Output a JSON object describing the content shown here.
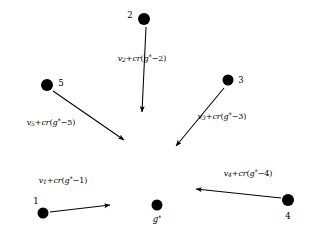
{
  "diagram": {
    "background_color": "#ffffff",
    "stroke_color": "#000000",
    "center": {
      "id": "g-star",
      "label_var": "g",
      "label_sup": "*",
      "x": 157,
      "y": 205,
      "radius": 5.5,
      "label_x": 157,
      "label_y": 219
    },
    "nodes": [
      {
        "id": "node-1",
        "label": "1",
        "x": 43,
        "y": 213,
        "radius": 5.5,
        "label_x": 36,
        "label_y": 201
      },
      {
        "id": "node-2",
        "label": "2",
        "x": 144,
        "y": 19,
        "radius": 6.0,
        "label_x": 130,
        "label_y": 15
      },
      {
        "id": "node-3",
        "label": "3",
        "x": 228,
        "y": 80,
        "radius": 5.5,
        "label_x": 241,
        "label_y": 80
      },
      {
        "id": "node-4",
        "label": "4",
        "x": 288,
        "y": 200,
        "radius": 6.0,
        "label_x": 288,
        "label_y": 216
      },
      {
        "id": "node-5",
        "label": "5",
        "x": 47,
        "y": 85,
        "radius": 6.0,
        "label_x": 61,
        "label_y": 83
      }
    ],
    "edges": [
      {
        "id": "edge-1",
        "from": "node-1",
        "to": "g-star",
        "x1": 50,
        "y1": 212,
        "x2": 110,
        "y2": 205,
        "label_var": "v",
        "label_sub": "1",
        "label_fn": "cr",
        "label_sup": "*",
        "label_num": "1",
        "label_text": "v1+cr(g*-1)",
        "label_x": 63,
        "label_y": 180
      },
      {
        "id": "edge-2",
        "from": "node-2",
        "to": "g-star",
        "x1": 146,
        "y1": 27,
        "x2": 142,
        "y2": 112,
        "label_var": "v",
        "label_sub": "2",
        "label_fn": "cr",
        "label_sup": "*",
        "label_num": "2",
        "label_text": "v2+cr(g*-2)",
        "label_x": 142,
        "label_y": 58
      },
      {
        "id": "edge-3",
        "from": "node-3",
        "to": "g-star",
        "x1": 224,
        "y1": 88,
        "x2": 176,
        "y2": 146,
        "label_var": "v",
        "label_sub": "3",
        "label_fn": "cr",
        "label_sup": "*",
        "label_num": "3",
        "label_text": "v3+cr(g*-3)",
        "label_x": 222,
        "label_y": 116
      },
      {
        "id": "edge-4",
        "from": "node-4",
        "to": "g-star",
        "x1": 281,
        "y1": 198,
        "x2": 196,
        "y2": 189,
        "label_var": "v",
        "label_sub": "4",
        "label_fn": "cr",
        "label_sup": "*",
        "label_num": "4",
        "label_text": "v4+cr(g*-4)",
        "label_x": 248,
        "label_y": 173
      },
      {
        "id": "edge-5",
        "from": "node-5",
        "to": "g-star",
        "x1": 53,
        "y1": 91,
        "x2": 124,
        "y2": 140,
        "label_var": "v",
        "label_sub": "5",
        "label_fn": "cr",
        "label_sup": "*",
        "label_num": "5",
        "label_text": "v5+cr(g*-5)",
        "label_x": 51,
        "label_y": 122
      }
    ]
  }
}
